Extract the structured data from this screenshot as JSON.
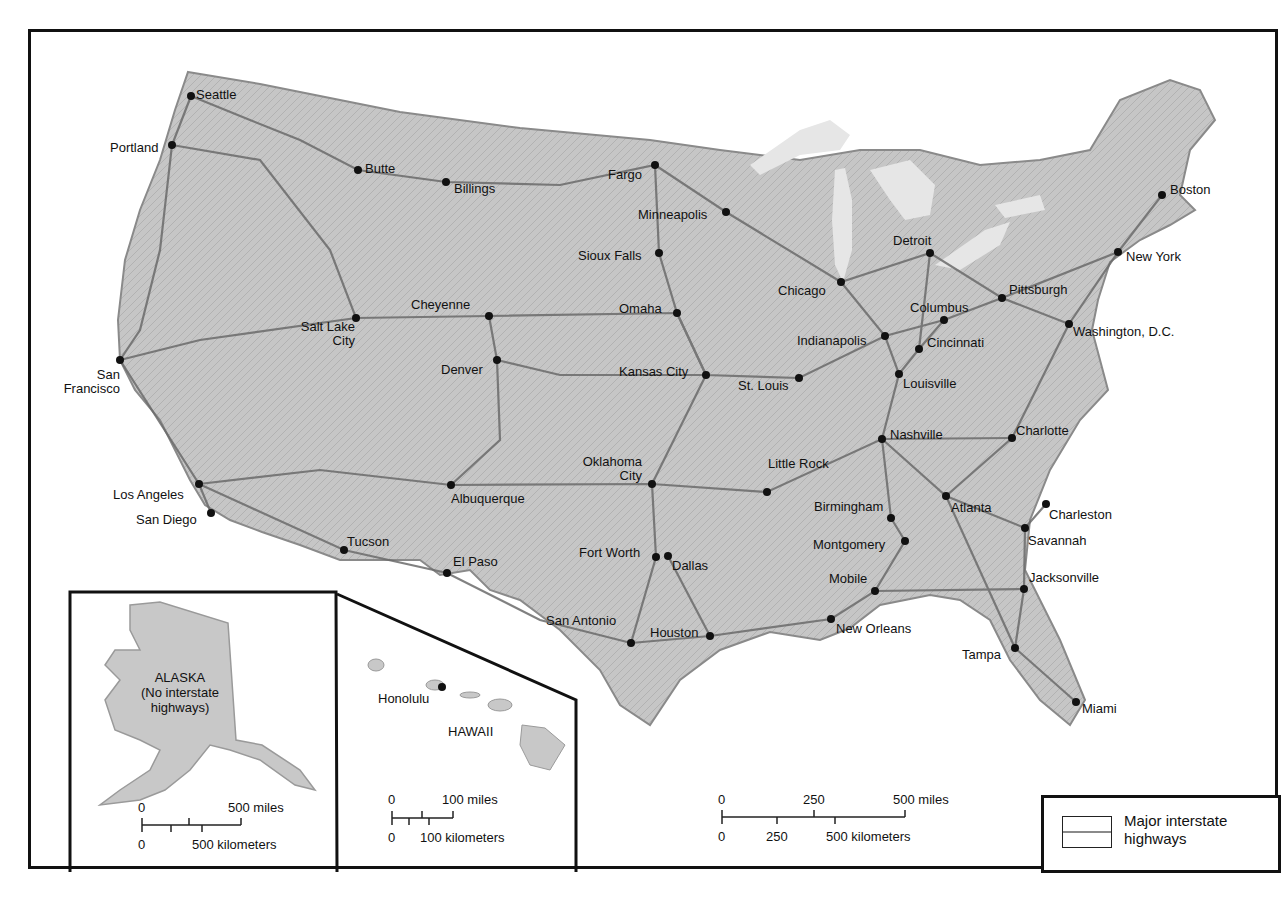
{
  "map": {
    "title": "Major interstate highways of the United States",
    "colors": {
      "land": "#c8c8c8",
      "land_dark": "#a9a9a9",
      "highway": "#6b6b6b",
      "border": "#111111",
      "water": "#ffffff",
      "lakes": "#e6e6e6"
    },
    "cities": [
      {
        "name": "Seattle",
        "dot": [
          191,
          96
        ],
        "label": [
          196,
          88
        ]
      },
      {
        "name": "Portland",
        "dot": [
          172,
          145
        ],
        "label": [
          110,
          141
        ]
      },
      {
        "name": "Butte",
        "dot": [
          358,
          170
        ],
        "label": [
          365,
          162
        ]
      },
      {
        "name": "Billings",
        "dot": [
          446,
          182
        ],
        "label": [
          454,
          182
        ]
      },
      {
        "name": "Fargo",
        "dot": [
          655,
          165
        ],
        "label": [
          608,
          168
        ]
      },
      {
        "name": "Minneapolis",
        "dot": [
          726,
          212
        ],
        "label": [
          638,
          208
        ]
      },
      {
        "name": "Sioux Falls",
        "dot": [
          659,
          253
        ],
        "label": [
          578,
          249
        ]
      },
      {
        "name": "Boston",
        "dot": [
          1162,
          195
        ],
        "label": [
          1170,
          183
        ]
      },
      {
        "name": "Detroit",
        "dot": [
          930,
          253
        ],
        "label": [
          893,
          234
        ]
      },
      {
        "name": "New York",
        "dot": [
          1118,
          252
        ],
        "label": [
          1126,
          250
        ]
      },
      {
        "name": "Chicago",
        "dot": [
          841,
          282
        ],
        "label": [
          778,
          284
        ]
      },
      {
        "name": "Pittsburgh",
        "dot": [
          1002,
          298
        ],
        "label": [
          1009,
          283
        ]
      },
      {
        "name": "Cheyenne",
        "dot": [
          489,
          316
        ],
        "label": [
          411,
          298
        ]
      },
      {
        "name": "Salt Lake City",
        "dot": [
          356,
          318
        ],
        "label": [
          285,
          320
        ]
      },
      {
        "name": "Omaha",
        "dot": [
          677,
          313
        ],
        "label": [
          619,
          302
        ]
      },
      {
        "name": "Columbus",
        "dot": [
          944,
          320
        ],
        "label": [
          910,
          301
        ]
      },
      {
        "name": "Washington, D.C.",
        "dot": [
          1069,
          324
        ],
        "label": [
          1073,
          325
        ]
      },
      {
        "name": "Indianapolis",
        "dot": [
          885,
          336
        ],
        "label": [
          797,
          334
        ]
      },
      {
        "name": "Cincinnati",
        "dot": [
          919,
          349
        ],
        "label": [
          927,
          336
        ]
      },
      {
        "name": "San Francisco",
        "dot": [
          120,
          360
        ],
        "label": [
          50,
          368
        ]
      },
      {
        "name": "Denver",
        "dot": [
          497,
          360
        ],
        "label": [
          441,
          363
        ]
      },
      {
        "name": "Kansas City",
        "dot": [
          706,
          375
        ],
        "label": [
          619,
          365
        ]
      },
      {
        "name": "St. Louis",
        "dot": [
          799,
          378
        ],
        "label": [
          738,
          379
        ]
      },
      {
        "name": "Louisville",
        "dot": [
          899,
          374
        ],
        "label": [
          903,
          377
        ]
      },
      {
        "name": "Nashville",
        "dot": [
          882,
          439
        ],
        "label": [
          890,
          428
        ]
      },
      {
        "name": "Charlotte",
        "dot": [
          1012,
          438
        ],
        "label": [
          1016,
          424
        ]
      },
      {
        "name": "Oklahoma City",
        "dot": [
          652,
          484
        ],
        "label": [
          572,
          455
        ]
      },
      {
        "name": "Little Rock",
        "dot": [
          767,
          492
        ],
        "label": [
          768,
          457
        ]
      },
      {
        "name": "Los Angeles",
        "dot": [
          199,
          484
        ],
        "label": [
          113,
          488
        ]
      },
      {
        "name": "Albuquerque",
        "dot": [
          451,
          485
        ],
        "label": [
          451,
          492
        ]
      },
      {
        "name": "Atlanta",
        "dot": [
          946,
          496
        ],
        "label": [
          951,
          501
        ]
      },
      {
        "name": "Birmingham",
        "dot": [
          891,
          518
        ],
        "label": [
          814,
          500
        ]
      },
      {
        "name": "Charleston",
        "dot": [
          1046,
          504
        ],
        "label": [
          1049,
          508
        ]
      },
      {
        "name": "San Diego",
        "dot": [
          211,
          513
        ],
        "label": [
          136,
          513
        ]
      },
      {
        "name": "Savannah",
        "dot": [
          1025,
          528
        ],
        "label": [
          1028,
          534
        ]
      },
      {
        "name": "Montgomery",
        "dot": [
          905,
          541
        ],
        "label": [
          813,
          538
        ]
      },
      {
        "name": "Tucson",
        "dot": [
          344,
          550
        ],
        "label": [
          347,
          535
        ]
      },
      {
        "name": "Fort Worth",
        "dot": [
          656,
          557
        ],
        "label": [
          579,
          546
        ]
      },
      {
        "name": "Dallas",
        "dot": [
          668,
          556
        ],
        "label": [
          672,
          559
        ]
      },
      {
        "name": "El Paso",
        "dot": [
          447,
          573
        ],
        "label": [
          453,
          555
        ]
      },
      {
        "name": "Mobile",
        "dot": [
          875,
          591
        ],
        "label": [
          829,
          572
        ]
      },
      {
        "name": "Jacksonville",
        "dot": [
          1024,
          589
        ],
        "label": [
          1029,
          571
        ]
      },
      {
        "name": "San Antonio",
        "dot": [
          631,
          643
        ],
        "label": [
          546,
          614
        ]
      },
      {
        "name": "New Orleans",
        "dot": [
          831,
          619
        ],
        "label": [
          836,
          622
        ]
      },
      {
        "name": "Houston",
        "dot": [
          710,
          636
        ],
        "label": [
          650,
          626
        ]
      },
      {
        "name": "Tampa",
        "dot": [
          1015,
          648
        ],
        "label": [
          962,
          648
        ]
      },
      {
        "name": "Miami",
        "dot": [
          1076,
          702
        ],
        "label": [
          1082,
          702
        ]
      }
    ]
  },
  "insets": {
    "alaska": {
      "title": "ALASKA",
      "note": "(No interstate highways)",
      "note_line1": "(No interstate",
      "note_line2": "highways)",
      "scale": {
        "miles_zero": "0",
        "miles_max": "500 miles",
        "km_zero": "0",
        "km_max": "500 kilometers"
      }
    },
    "hawaii": {
      "title": "HAWAII",
      "city": "Honolulu",
      "scale": {
        "miles_zero": "0",
        "miles_max": "100 miles",
        "km_zero": "0",
        "km_max": "100 kilometers"
      }
    }
  },
  "main_scale": {
    "miles_zero": "0",
    "miles_mid": "250",
    "miles_max": "500 miles",
    "km_zero": "0",
    "km_mid": "250",
    "km_max": "500 kilometers"
  },
  "legend": {
    "line1": "Major interstate",
    "line2": "highways",
    "label": "Major interstate highways"
  }
}
